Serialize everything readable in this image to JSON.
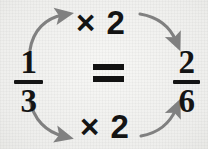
{
  "diagram": {
    "background_color": "#f2f2f0",
    "ink_color": "#141414",
    "arrow_color": "#808080",
    "equation": {
      "left_fraction": {
        "numerator": "1",
        "denominator": "3"
      },
      "relation": "=",
      "right_fraction": {
        "numerator": "2",
        "denominator": "6"
      }
    },
    "operations": {
      "top_label": "× 2",
      "bottom_label": "× 2"
    },
    "arrows": [
      {
        "name": "arrow-top-left",
        "from": "left-numerator",
        "to": "top-label",
        "direction": "up-right"
      },
      {
        "name": "arrow-top-right",
        "from": "top-label",
        "to": "right-numerator",
        "direction": "down-right"
      },
      {
        "name": "arrow-bottom-left",
        "from": "left-denominator",
        "to": "bottom-label",
        "direction": "down-right"
      },
      {
        "name": "arrow-bottom-right",
        "from": "bottom-label",
        "to": "right-denominator",
        "direction": "up-right"
      }
    ]
  }
}
